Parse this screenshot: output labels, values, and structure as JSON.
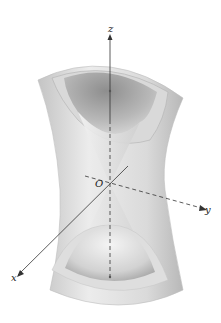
{
  "diagram": {
    "type": "3d-surface",
    "axes": {
      "z_label": "z",
      "y_label": "y",
      "x_label": "x",
      "origin_label": "O"
    },
    "colors": {
      "surface_light": "#e6e6e6",
      "surface_mid": "#c8c8c8",
      "surface_dark": "#9a9a9a",
      "axis": "#333333"
    }
  }
}
